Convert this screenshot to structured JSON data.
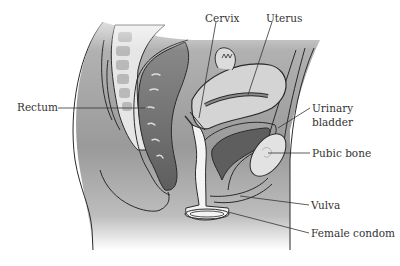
{
  "figure": {
    "labels": [
      {
        "id": "rectum",
        "text": "Rectum",
        "x": 17,
        "y": 101
      },
      {
        "id": "cervix",
        "text": "Cervix",
        "x": 205,
        "y": 13
      },
      {
        "id": "uterus",
        "text": "Uterus",
        "x": 266,
        "y": 13
      },
      {
        "id": "urinary-bladder-line1",
        "text": "Urinary",
        "x": 312,
        "y": 103
      },
      {
        "id": "urinary-bladder-line2",
        "text": "bladder",
        "x": 312,
        "y": 117
      },
      {
        "id": "pubic-bone",
        "text": "Pubic bone",
        "x": 312,
        "y": 148
      },
      {
        "id": "vulva",
        "text": "Vulva",
        "x": 311,
        "y": 200
      },
      {
        "id": "female-condom",
        "text": "Female condom",
        "x": 311,
        "y": 228
      }
    ],
    "colors": {
      "body_fill": "#9a9a9a",
      "organ_dark": "#6e6e6e",
      "organ_light": "#d8d8d8",
      "outline": "#2a2a2a",
      "text": "#333333",
      "leader_line": "#333333",
      "background": "#ffffff"
    }
  }
}
